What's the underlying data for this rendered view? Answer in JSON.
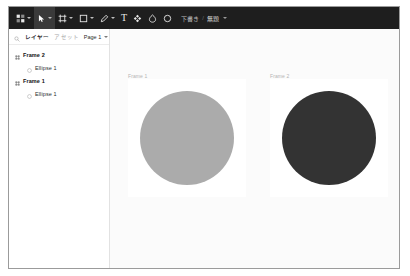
{
  "window": {
    "title": "Design Editor"
  },
  "toolbar": {
    "tools": [
      {
        "name": "menu-tool",
        "icon": "app-menu-icon",
        "label": "",
        "has_caret": true,
        "active": false
      },
      {
        "name": "move-tool",
        "icon": "cursor-icon",
        "label": "",
        "has_caret": true,
        "active": true
      },
      {
        "name": "frame-tool",
        "icon": "frame-icon",
        "label": "",
        "has_caret": true,
        "active": false
      },
      {
        "name": "shape-tool",
        "icon": "square-icon",
        "label": "",
        "has_caret": true,
        "active": false
      },
      {
        "name": "pen-tool",
        "icon": "pen-icon",
        "label": "",
        "has_caret": true,
        "active": false
      },
      {
        "name": "text-tool",
        "icon": "text-icon",
        "label": "T",
        "has_caret": false,
        "active": false
      },
      {
        "name": "component-tool",
        "icon": "component-icon",
        "label": "",
        "has_caret": false,
        "active": false
      },
      {
        "name": "shape-filled",
        "icon": "blob-icon",
        "label": "",
        "has_caret": false,
        "active": false
      },
      {
        "name": "ellipse-tool",
        "icon": "ellipse-icon",
        "label": "",
        "has_caret": false,
        "active": false
      }
    ],
    "document": {
      "status_label": "下書き",
      "separator": "/",
      "title": "無題"
    }
  },
  "left_panel": {
    "search_icon": "search-icon",
    "tabs": [
      {
        "label": "レイヤー",
        "selected": true
      },
      {
        "label": "アセット",
        "selected": false
      }
    ],
    "page_selector": {
      "label": "Page 1"
    },
    "layers": [
      {
        "name": "Frame 2",
        "type": "frame",
        "depth": 0
      },
      {
        "name": "Ellipse 1",
        "type": "ellipse",
        "depth": 1
      },
      {
        "name": "Frame 1",
        "type": "frame",
        "depth": 0
      },
      {
        "name": "Ellipse 1",
        "type": "ellipse",
        "depth": 1
      }
    ]
  },
  "canvas": {
    "background": "#fbfbfb",
    "frames": [
      {
        "label": "Frame 1",
        "label_x": 18,
        "label_y": 44,
        "x": 18,
        "y": 50,
        "width": 118,
        "height": 118,
        "fill": "#ffffff",
        "shape": {
          "name": "Ellipse 1",
          "type": "ellipse",
          "x": 12,
          "y": 12,
          "width": 94,
          "height": 94,
          "fill": "#ababab"
        }
      },
      {
        "label": "Frame 2",
        "label_x": 160,
        "label_y": 44,
        "x": 160,
        "y": 50,
        "width": 118,
        "height": 118,
        "fill": "#ffffff",
        "shape": {
          "name": "Ellipse 1",
          "type": "ellipse",
          "x": 12,
          "y": 12,
          "width": 94,
          "height": 94,
          "fill": "#333333"
        }
      }
    ]
  },
  "colors": {
    "toolbar_bg": "#1e1e1e",
    "active_tool_bg": "#3a3a3a",
    "panel_bg": "#ffffff",
    "canvas_bg": "#fbfbfb",
    "border": "#9b9b9b",
    "light_circle": "#ababab",
    "dark_circle": "#333333"
  }
}
